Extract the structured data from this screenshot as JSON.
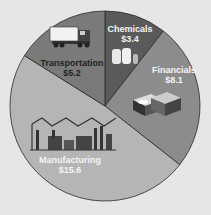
{
  "chart_data": {
    "type": "pie",
    "title": "",
    "unit": "$",
    "categories": [
      "Chemicals",
      "Financials",
      "Manufacturing",
      "Transportation"
    ],
    "values": [
      3.4,
      8.1,
      15.6,
      5.2
    ],
    "labels": [
      "$3.4",
      "$8.1",
      "$15.6",
      "$5.2"
    ],
    "colors": [
      "#5a5a5a",
      "#8c8c8c",
      "#b5b5b5",
      "#7a7a7a"
    ],
    "start_angle_deg": 0,
    "direction": "clockwise",
    "legend": "none (labels inside slices)"
  },
  "slices": [
    {
      "name": "Chemicals",
      "value": "$3.4",
      "icon": "chemical-tanks-icon"
    },
    {
      "name": "Financials",
      "value": "$8.1",
      "icon": "money-stacks-icon"
    },
    {
      "name": "Manufacturing",
      "value": "$15.6",
      "icon": "factory-icon"
    },
    {
      "name": "Transportation",
      "value": "$5.2",
      "icon": "truck-icon"
    }
  ]
}
